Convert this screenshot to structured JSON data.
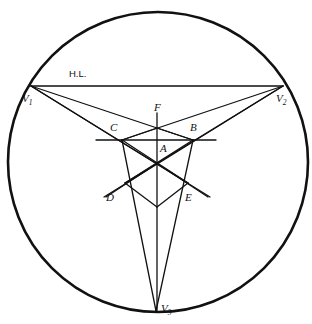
{
  "figure": {
    "background_color": "#ffffff",
    "stroke_color": "#111111",
    "canvas": {
      "width": 312,
      "height": 324
    }
  },
  "labels": {
    "horizon_line": "H.L.",
    "v1": "V",
    "v1_sub": "1",
    "v2": "V",
    "v2_sub": "2",
    "v3": "V",
    "v3_sub": "3",
    "a": "A",
    "b": "B",
    "c": "C",
    "d": "D",
    "e": "E",
    "f": "F"
  },
  "geometry": {
    "circle": {
      "cx": 158,
      "cy": 162,
      "r": 150,
      "stroke_width": 2.6
    },
    "points": {
      "V1": {
        "x": 31,
        "y": 86
      },
      "V2": {
        "x": 283,
        "y": 86
      },
      "V3": {
        "x": 156,
        "y": 311
      },
      "F": {
        "x": 157,
        "y": 128
      },
      "C": {
        "x": 122,
        "y": 140
      },
      "B": {
        "x": 193,
        "y": 140
      },
      "A": {
        "x": 157,
        "y": 163
      },
      "D": {
        "x": 125,
        "y": 183
      },
      "E": {
        "x": 188,
        "y": 183
      },
      "G": {
        "x": 157,
        "y": 207
      }
    },
    "horizon_line": {
      "x1": 31,
      "y1": 86,
      "x2": 283,
      "y2": 86
    },
    "mid_horizontal": {
      "x1": 96,
      "y1": 140,
      "x2": 216,
      "y2": 140
    },
    "vertical_axis": {
      "x1": 157,
      "y1": 113,
      "x2": 157,
      "y2": 311
    },
    "stroke_width_main": 1.3
  }
}
